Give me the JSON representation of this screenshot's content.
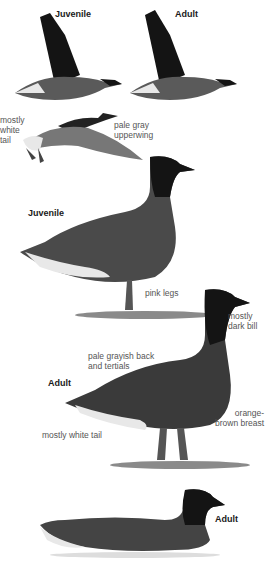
{
  "plate": {
    "figures": [
      {
        "id": "flight-juvenile",
        "age_label": "Juvenile"
      },
      {
        "id": "flight-adult",
        "age_label": "Adult"
      },
      {
        "id": "flight-upperwing",
        "labels": [
          "mostly\nwhite\ntail",
          "pale gray\nupperwing"
        ]
      },
      {
        "id": "standing-juvenile",
        "age_label": "Juvenile",
        "labels": [
          "pink legs"
        ]
      },
      {
        "id": "standing-adult",
        "age_label": "Adult",
        "labels": [
          "mostly\ndark bill",
          "pale grayish back\nand tertials",
          "orange-\nbrown breast",
          "mostly white tail"
        ]
      },
      {
        "id": "swimming-adult",
        "age_label": "Adult"
      }
    ]
  },
  "colors": {
    "head": "#141414",
    "body": "#555555",
    "wing": "#3a3a3a",
    "pale": "#e8e8e8",
    "ground": "#8a8a8a"
  }
}
